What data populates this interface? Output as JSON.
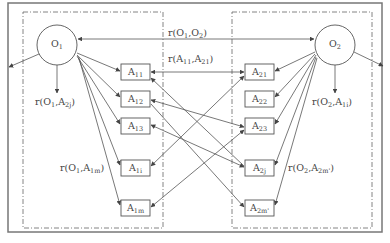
{
  "diagram": {
    "colors": {
      "line": "#555555",
      "frame": "#777777",
      "text": "#444444",
      "background": "#ffffff"
    },
    "objects": [
      {
        "id": "O1",
        "label": "O",
        "sub": "1",
        "cx": 57,
        "cy": 45,
        "r": 20
      },
      {
        "id": "O2",
        "label": "O",
        "sub": "2",
        "cx": 335,
        "cy": 45,
        "r": 20
      }
    ],
    "attributes_left": [
      {
        "id": "A11",
        "label": "A",
        "sub": "11",
        "y": 64
      },
      {
        "id": "A12",
        "label": "A",
        "sub": "12",
        "y": 91
      },
      {
        "id": "A13",
        "label": "A",
        "sub": "13",
        "y": 118
      },
      {
        "id": "A1i",
        "label": "A",
        "sub": "1i",
        "y": 160
      },
      {
        "id": "A1m",
        "label": "A",
        "sub": "1m",
        "y": 200
      }
    ],
    "attributes_right": [
      {
        "id": "A21",
        "label": "A",
        "sub": "21",
        "y": 64
      },
      {
        "id": "A22",
        "label": "A",
        "sub": "22",
        "y": 91
      },
      {
        "id": "A23",
        "label": "A",
        "sub": "23",
        "y": 118
      },
      {
        "id": "A2j",
        "label": "A",
        "sub": "2j",
        "y": 160
      },
      {
        "id": "A2m'",
        "label": "A",
        "sub": "2m'",
        "y": 200
      }
    ],
    "relations": [
      {
        "id": "r_O1_O2",
        "text": "r(O",
        "s1": "1",
        "mid": ",O",
        "s2": "2",
        "end": ")",
        "x": 168,
        "y": 36
      },
      {
        "id": "r_A11_A21",
        "text": "r(A",
        "s1": "11",
        "mid": ",A",
        "s2": "21",
        "end": ")",
        "x": 168,
        "y": 62
      },
      {
        "id": "r_O1_A2j",
        "text": "r(O",
        "s1": "1",
        "mid": ",A",
        "s2": "2j",
        "end": ")",
        "x": 35,
        "y": 105
      },
      {
        "id": "r_O2_A1i",
        "text": "r(O",
        "s1": "2",
        "mid": ",A",
        "s2": "1i",
        "end": ")",
        "x": 312,
        "y": 105
      },
      {
        "id": "r_O1_A1m",
        "text": "r(O",
        "s1": "1",
        "mid": ",A",
        "s2": "1m",
        "end": ")",
        "x": 60,
        "y": 171
      },
      {
        "id": "r_O2_A2m",
        "text": "r(O",
        "s1": "2",
        "mid": ",A",
        "s2": "2m'",
        "end": ")",
        "x": 288,
        "y": 171
      }
    ]
  }
}
